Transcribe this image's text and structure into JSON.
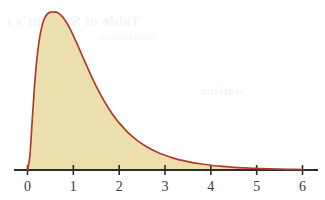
{
  "figure": {
    "name": "probability-density-curve",
    "background_color": "#ffffff",
    "curve_color": "#b23a2e",
    "fill_color": "#ebdfae",
    "axis_color": "#2e2b28"
  },
  "background_bleed": {
    "note": "faint scanner show-through from reverse page",
    "lines": [
      "Table of Student's t",
      "distribution",
      "Chi-square",
      "statistic",
      "critical"
    ]
  },
  "chart_data": {
    "type": "area",
    "title": "",
    "subtitle": "",
    "xlabel": "",
    "ylabel": "",
    "grid": false,
    "legend": false,
    "legend_position": "none",
    "xlim": [
      -0.15,
      6.35
    ],
    "ylim": [
      0,
      1.08
    ],
    "xticks": [
      0,
      1,
      2,
      3,
      4,
      5,
      6
    ],
    "xtick_labels": [
      "0",
      "1",
      "2",
      "3",
      "4",
      "5",
      "6"
    ],
    "yticks": [],
    "ytick_labels": [],
    "curve_label": "right-skewed density",
    "peak_x": 0.63,
    "peak_y": 1.0,
    "x": [
      0.0,
      0.05,
      0.1,
      0.15,
      0.2,
      0.25,
      0.3,
      0.35,
      0.4,
      0.45,
      0.5,
      0.55,
      0.6,
      0.63,
      0.65,
      0.7,
      0.75,
      0.8,
      0.85,
      0.9,
      0.95,
      1.0,
      1.1,
      1.2,
      1.3,
      1.4,
      1.5,
      1.6,
      1.7,
      1.8,
      1.9,
      2.0,
      2.2,
      2.4,
      2.6,
      2.8,
      3.0,
      3.2,
      3.4,
      3.6,
      3.8,
      4.0,
      4.25,
      4.5,
      4.75,
      5.0,
      5.25,
      5.5,
      5.75,
      6.0
    ],
    "y": [
      0.0,
      0.085,
      0.3,
      0.52,
      0.69,
      0.81,
      0.89,
      0.945,
      0.975,
      0.992,
      0.999,
      1.0,
      0.999,
      1.0,
      0.997,
      0.988,
      0.974,
      0.956,
      0.934,
      0.909,
      0.881,
      0.851,
      0.787,
      0.72,
      0.654,
      0.59,
      0.53,
      0.474,
      0.423,
      0.377,
      0.335,
      0.298,
      0.235,
      0.186,
      0.147,
      0.117,
      0.093,
      0.074,
      0.059,
      0.047,
      0.038,
      0.03,
      0.023,
      0.017,
      0.013,
      0.01,
      0.007,
      0.005,
      0.004,
      0.003
    ]
  }
}
